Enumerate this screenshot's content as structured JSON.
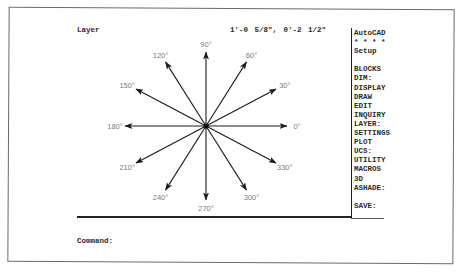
{
  "app": {
    "name": "AutoCAD"
  },
  "status_bar": {
    "layer_label": "Layer",
    "coordinates": "1'-0 5/8\",   0'-2 1/2\""
  },
  "screen_menu": {
    "items": [
      {
        "label": "AutoCAD"
      },
      {
        "label": "* * * *"
      },
      {
        "label": "Setup"
      },
      {
        "label": ""
      },
      {
        "label": "BLOCKS"
      },
      {
        "label": "DIM:"
      },
      {
        "label": "DISPLAY"
      },
      {
        "label": "DRAW"
      },
      {
        "label": "EDIT"
      },
      {
        "label": "INQUIRY"
      },
      {
        "label": "LAYER:"
      },
      {
        "label": "SETTINGS"
      },
      {
        "label": "PLOT"
      },
      {
        "label": "UCS:"
      },
      {
        "label": "UTILITY"
      },
      {
        "label": "MACROS"
      },
      {
        "label": "3D"
      },
      {
        "label": "ASHADE:"
      },
      {
        "label": ""
      },
      {
        "label": "SAVE:"
      }
    ]
  },
  "drawing": {
    "center": [
      206,
      126
    ],
    "radius_x": 81,
    "radius_y": 74,
    "line_color": "#1a1a1a",
    "label_color": "#7a7a7a",
    "angles": [
      {
        "deg": 0,
        "label": "0°"
      },
      {
        "deg": 30,
        "label": "30°"
      },
      {
        "deg": 60,
        "label": "60°"
      },
      {
        "deg": 90,
        "label": "90°"
      },
      {
        "deg": 120,
        "label": "120°"
      },
      {
        "deg": 150,
        "label": "150°"
      },
      {
        "deg": 180,
        "label": "180°"
      },
      {
        "deg": 210,
        "label": "210°"
      },
      {
        "deg": 240,
        "label": "240°"
      },
      {
        "deg": 270,
        "label": "270°"
      },
      {
        "deg": 300,
        "label": "300°"
      },
      {
        "deg": 330,
        "label": "330°"
      }
    ]
  },
  "command_line": {
    "prompt": "Command:"
  }
}
